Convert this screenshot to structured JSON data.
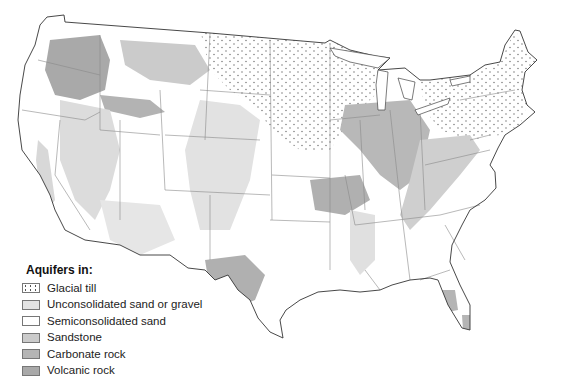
{
  "map": {
    "subject": "Principal aquifers of the conterminous United States",
    "legend": {
      "title": "Aquifers in:",
      "items": [
        {
          "label": "Glacial till",
          "color": "#ffffff",
          "pattern": "dots"
        },
        {
          "label": "Unconsolidated sand or gravel",
          "color": "#e3e3e3",
          "pattern": "solid"
        },
        {
          "label": "Semiconsolidated sand",
          "color": "#ffffff",
          "pattern": "solid"
        },
        {
          "label": "Sandstone",
          "color": "#cbcbcb",
          "pattern": "solid"
        },
        {
          "label": "Carbonate rock",
          "color": "#b5b5b5",
          "pattern": "solid"
        },
        {
          "label": "Volcanic rock",
          "color": "#a9a9a9",
          "pattern": "solid"
        }
      ]
    },
    "colors": {
      "outline": "#333333",
      "state_border": "#8a8a8a",
      "background": "#ffffff"
    }
  }
}
